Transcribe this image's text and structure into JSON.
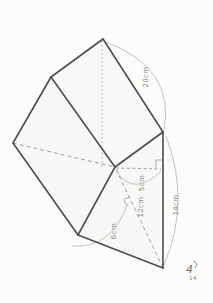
{
  "figure": {
    "type": "geometry-solid-diagram",
    "labels": {
      "slant_edge": "20cm",
      "right_edge": "14cm",
      "inner_height": "5cm",
      "diagonal": "12cm",
      "base_height": "6cm"
    },
    "signature": {
      "main": "4",
      "sub": "14"
    },
    "colors": {
      "paper": "#fcfcfb",
      "face": "#f7f7f5",
      "solid_edge": "#4d4d4d",
      "hidden_edge": "#a0a0a0",
      "dimension_line": "#bcbcbc",
      "label_text": "#8a8a8a"
    }
  }
}
